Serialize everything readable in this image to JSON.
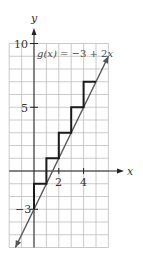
{
  "chart_data": {
    "type": "line",
    "title": "",
    "xlabel": "x",
    "ylabel": "y",
    "xlim": [
      -2,
      6
    ],
    "ylim": [
      -6,
      10
    ],
    "grid": true,
    "grid_step": 1,
    "x_ticks": [
      {
        "value": 2,
        "label": "2"
      },
      {
        "value": 4,
        "label": "4"
      }
    ],
    "y_ticks": [
      {
        "value": 10,
        "label": "10"
      },
      {
        "value": 5,
        "label": "5"
      },
      {
        "value": -3,
        "label": "−3"
      }
    ],
    "series": [
      {
        "name": "g(x) = −3 + 2x",
        "kind": "line",
        "color": "#555555",
        "equation": {
          "intercept": -3,
          "slope": 2
        },
        "x": [
          -1.5,
          6
        ],
        "y": [
          -6,
          9
        ],
        "arrows": "both"
      },
      {
        "name": "step approximation",
        "kind": "step",
        "color": "#1a1a1a",
        "points": [
          [
            0,
            -3
          ],
          [
            0,
            -1
          ],
          [
            1,
            -1
          ],
          [
            1,
            1
          ],
          [
            2,
            1
          ],
          [
            2,
            3
          ],
          [
            3,
            3
          ],
          [
            3,
            5
          ],
          [
            4,
            5
          ],
          [
            4,
            7
          ],
          [
            5,
            7
          ]
        ]
      }
    ],
    "annotations": [
      {
        "text_prefix": "g(x) = −3 + 2",
        "text_var": "x",
        "x": 0.1,
        "y": 9.3
      }
    ]
  },
  "labels": {
    "x_axis": "x",
    "y_axis": "y",
    "equation_func": "g(x)",
    "equation_rest": " = −3 + 2",
    "equation_var": "x",
    "tick_2": "2",
    "tick_4": "4",
    "tick_10": "10",
    "tick_5": "5",
    "tick_neg3": "−3"
  },
  "colors": {
    "grid": "#bdbdbd",
    "axis": "#222222",
    "line": "#555555",
    "step": "#1a1a1a"
  }
}
